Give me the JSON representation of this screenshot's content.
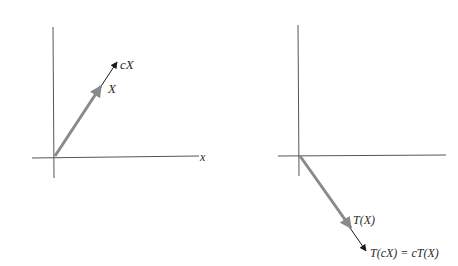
{
  "figure": {
    "left_panel": {
      "title": "vector X and scalar multiple cX",
      "x_axis_label": "x",
      "vector_x_label": "X",
      "vector_cx_label": "cX"
    },
    "right_panel": {
      "title": "images under linear transformation T",
      "vector_tx_label": "T(X)",
      "vector_tcx_label": "T(cX) = cT(X)"
    },
    "colors": {
      "axis": "#555555",
      "vector_gray": "#8a8a8a",
      "vector_black": "#1a1a1a",
      "background": "#ffffff"
    }
  }
}
